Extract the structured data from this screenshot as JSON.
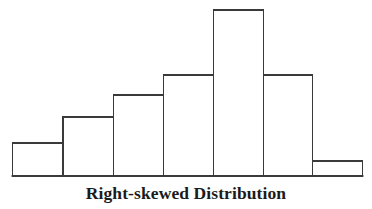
{
  "figure": {
    "caption": "Right-skewed Distribution",
    "background_color": "#ffffff",
    "bar_fill_color": "#ffffff",
    "bar_stroke_color": "#3a3a3a",
    "axis_color": "#3a3a3a"
  },
  "chart_data": {
    "type": "bar",
    "title": "Right-skewed Distribution",
    "subtitle": "",
    "xlabel": "",
    "ylabel": "",
    "categories": [
      "1",
      "2",
      "3",
      "4",
      "5",
      "6",
      "7"
    ],
    "values": [
      33,
      59,
      81,
      101,
      166,
      101,
      15
    ],
    "ylim": [
      0,
      176
    ],
    "xlim": [
      0,
      7
    ],
    "grid": false,
    "legend": null,
    "annotations": [],
    "bar_geometry": [
      {
        "index": 1,
        "x": 12.5,
        "width": 50.5,
        "top": 143,
        "height": 33
      },
      {
        "index": 2,
        "x": 63.0,
        "width": 50.5,
        "top": 117,
        "height": 59
      },
      {
        "index": 3,
        "x": 113.5,
        "width": 50.0,
        "top": 95,
        "height": 81
      },
      {
        "index": 4,
        "x": 163.5,
        "width": 50.0,
        "top": 75,
        "height": 101
      },
      {
        "index": 5,
        "x": 213.5,
        "width": 50.0,
        "top": 10,
        "height": 166
      },
      {
        "index": 6,
        "x": 263.5,
        "width": 49.0,
        "top": 75,
        "height": 101
      },
      {
        "index": 7,
        "x": 312.5,
        "width": 50.0,
        "top": 161,
        "height": 15
      }
    ],
    "baseline_y": 176,
    "stroke_width": 1.6
  }
}
